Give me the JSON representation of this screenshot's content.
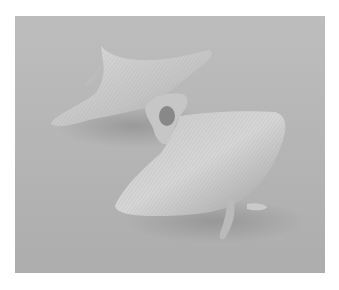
{
  "image": {
    "subject": "3D-printed mathematical surface sculpture",
    "background_color": "#b4b4b4",
    "surface_color": "#cfcfcf",
    "shadow_color": "#8e8e8e",
    "border_color": "#ffffff"
  }
}
